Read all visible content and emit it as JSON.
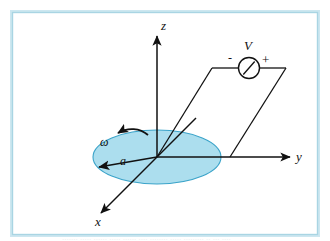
{
  "figure": {
    "background_color": "#ffffff",
    "border_color": "#a9d5e3",
    "border_inner_color": "#cde7f0",
    "line_color": "#111111",
    "disk_fill_color": "#a8dced",
    "disk_stroke_color": "#3aa3c9"
  },
  "axes": {
    "z_label": "z",
    "y_label": "y",
    "x_label": "x"
  },
  "disk": {
    "radius_label": "a",
    "angular_velocity_label": "ω"
  },
  "circuit": {
    "source_label": "V",
    "minus_label": "-",
    "plus_label": "+"
  },
  "caption": {
    "text": "....... ..... ...... ..... ...... .... ........ ..... ......... .. ... ...."
  }
}
